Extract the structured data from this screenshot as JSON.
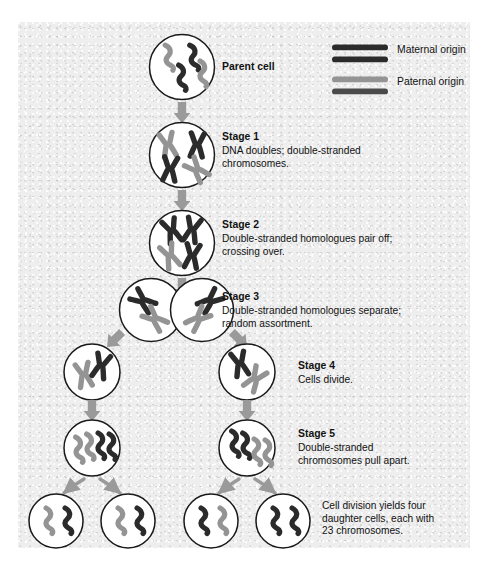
{
  "figure": {
    "panel": {
      "background_color": "#eeeeee",
      "left": 18,
      "top": 22,
      "width": 452,
      "height": 526
    },
    "colors": {
      "maternal": "#2b2b2b",
      "paternal": "#949494",
      "cell_outline": "#1a1a1a",
      "cell_fill": "#ffffff",
      "arrow": "#9a9a9a",
      "text": "#121212"
    }
  },
  "legend": {
    "name": "chromosome-origin-legend",
    "entries": [
      {
        "label": "Maternal origin",
        "color": "#2b2b2b",
        "bars": 2
      },
      {
        "label": "Paternal origin",
        "color": "#949494",
        "bars": 2
      }
    ]
  },
  "stages": [
    {
      "id": "parent-cell",
      "title": "Parent cell",
      "description": "",
      "cells": 1,
      "chromosome_form": "single-strand",
      "chromosomes_per_cell": 4
    },
    {
      "id": "stage-1",
      "title": "Stage 1",
      "description": "DNA doubles; double-stranded\nchromosomes.",
      "cells": 1,
      "chromosome_form": "double-strand",
      "chromosomes_per_cell": 4
    },
    {
      "id": "stage-2",
      "title": "Stage 2",
      "description": "Double-stranded homologues pair off;\ncrossing over.",
      "cells": 1,
      "chromosome_form": "double-strand-paired",
      "chromosomes_per_cell": 4
    },
    {
      "id": "stage-3",
      "title": "Stage 3",
      "description": "Double-stranded homologues separate;\nrandom assortment.",
      "cells": 2,
      "chromosome_form": "double-strand",
      "chromosomes_per_cell": 2
    },
    {
      "id": "stage-4",
      "title": "Stage 4",
      "description": "Cells divide.",
      "cells": 2,
      "chromosome_form": "double-strand",
      "chromosomes_per_cell": 2
    },
    {
      "id": "stage-5",
      "title": "Stage 5",
      "description": "Double-stranded\nchromosomes pull apart.",
      "cells": 2,
      "chromosome_form": "splitting",
      "chromosomes_per_cell": 4
    }
  ],
  "result": {
    "id": "daughter-cells",
    "caption": "Cell division yields four\ndaughter cells, each with\n23 chromosomes.",
    "cells": 4,
    "chromosomes_per_cell": 2
  }
}
